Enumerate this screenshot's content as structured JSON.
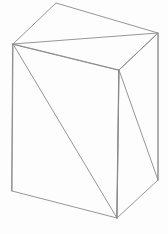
{
  "scene": {
    "title": "3D wireframe box",
    "background_color": "#fdfdfd",
    "canvas": {
      "width": 168,
      "height": 234
    },
    "stroke_color": "#8a8a8a",
    "stroke_width": 0.9,
    "projection": "oblique"
  },
  "geometry": {
    "vertices": {
      "top_apex": {
        "name": "top-back-left",
        "x": 56,
        "y": 3
      },
      "left_corner": {
        "name": "top-front-left",
        "x": 13,
        "y": 44
      },
      "right_corner": {
        "name": "top-back-right",
        "x": 158,
        "y": 33
      },
      "mid_corner": {
        "name": "top-front-right",
        "x": 119,
        "y": 70
      },
      "bottom_left": {
        "name": "bottom-front-left",
        "x": 12,
        "y": 191
      },
      "bottom_mid": {
        "name": "bottom-front-right",
        "x": 117,
        "y": 218
      },
      "bottom_right": {
        "name": "bottom-back-right",
        "x": 158,
        "y": 180
      }
    },
    "faces": [
      {
        "name": "top-face",
        "path": "M 13 44 L 56 3 L 158 33 L 119 70 Z"
      },
      {
        "name": "front-left-face",
        "path": "M 13 44 L 119 70 L 117 218 L 12 191 Z"
      },
      {
        "name": "right-face",
        "path": "M 119 70 L 158 33 L 158 180 L 117 218 Z"
      }
    ],
    "diagonals": [
      {
        "name": "top-face-diagonal",
        "path": "M 13 44 L 158 33"
      },
      {
        "name": "front-left-face-diagonal",
        "path": "M 13 44 L 117 218"
      },
      {
        "name": "right-face-diagonal",
        "path": "M 119 70 L 158 180"
      }
    ],
    "vertical_edges": [
      {
        "name": "left-vertical-edge",
        "path": "M 13 44 L 12 191"
      },
      {
        "name": "mid-vertical-edge",
        "path": "M 119 70 L 117 218"
      },
      {
        "name": "right-vertical-edge",
        "path": "M 158 33 L 158 180"
      }
    ]
  }
}
